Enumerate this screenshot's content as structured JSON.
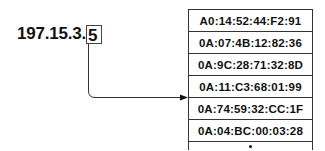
{
  "diagram": {
    "ip_address": {
      "prefix": "197.15.3.",
      "highlighted_octet": "5"
    },
    "table": {
      "rows": [
        "A0:14:52:44:F2:91",
        "0A:07:4B:12:82:36",
        "0A:9C:28:71:32:8D",
        "0A:11:C3:68:01:99",
        "0A:74:59:32:CC:1F",
        "0A:04:BC:00:03:28"
      ],
      "continuation": "⋮",
      "pointed_row_index": 4
    },
    "colors": {
      "line": "#333333",
      "text": "#111111",
      "background": "#ffffff"
    }
  }
}
